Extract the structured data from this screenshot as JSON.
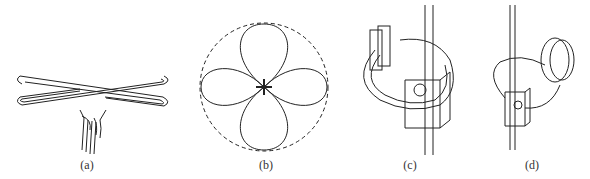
{
  "figure": {
    "panels": [
      {
        "id": "a",
        "label": "(a)",
        "description": "X-shaped crossed folded dipole antenna with feed cable"
      },
      {
        "id": "b",
        "label": "(b)",
        "description": "Four-lobe radiation pattern inside dashed circle"
      },
      {
        "id": "c",
        "label": "(c)",
        "description": "Curved element antenna mounted on mast with clamp block"
      },
      {
        "id": "d",
        "label": "(d)",
        "description": "Loop antenna with disc mounted on mast with clamp block"
      }
    ]
  },
  "colors": {
    "line": "#222222",
    "background": "#ffffff"
  }
}
